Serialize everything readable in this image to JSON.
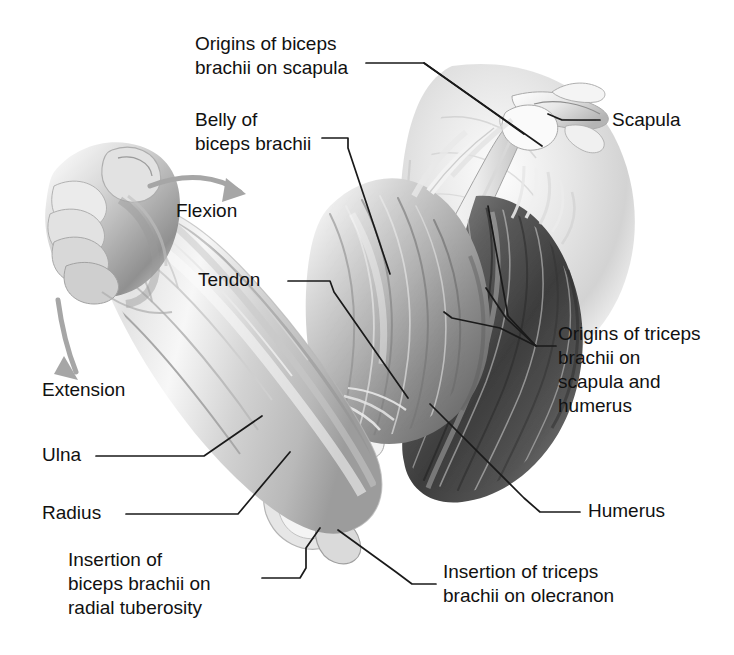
{
  "figure": {
    "background_color": "#ffffff",
    "ink_color": "#111111",
    "leader_line_color": "#1a1a1a",
    "motion_arrow_color": "#9a9a9a",
    "style": "grayscale medical illustration"
  },
  "labels": {
    "origins_biceps": "Origins of biceps\nbrachii on scapula",
    "belly_biceps": "Belly of\nbiceps brachii",
    "scapula": "Scapula",
    "tendon": "Tendon",
    "origins_triceps": "Origins of triceps\nbrachii on\nscapula and\nhumerus",
    "humerus": "Humerus",
    "insertion_triceps": "Insertion of triceps\nbrachii on olecranon",
    "insertion_biceps": "Insertion of\nbiceps brachii on\nradial tuberosity",
    "ulna": "Ulna",
    "radius": "Radius",
    "flexion": "Flexion",
    "extension": "Extension"
  },
  "motion_arrows": [
    {
      "name": "flexion-arrow",
      "direction": "clockwise-right",
      "label": "Flexion"
    },
    {
      "name": "extension-arrow",
      "direction": "down-left",
      "label": "Extension"
    }
  ],
  "anatomical_structures": [
    {
      "name": "fist",
      "region": "hand"
    },
    {
      "name": "forearm",
      "region": "forearm"
    },
    {
      "name": "ulna",
      "region": "forearm-bone"
    },
    {
      "name": "radius",
      "region": "forearm-bone"
    },
    {
      "name": "olecranon",
      "region": "elbow"
    },
    {
      "name": "biceps-brachii-belly",
      "region": "upper-arm-anterior"
    },
    {
      "name": "biceps-brachii-tendon",
      "region": "elbow-anterior"
    },
    {
      "name": "triceps-brachii",
      "region": "upper-arm-posterior"
    },
    {
      "name": "humerus",
      "region": "upper-arm-bone"
    },
    {
      "name": "scapula",
      "region": "shoulder"
    },
    {
      "name": "deltoid-shoulder-mass",
      "region": "shoulder"
    }
  ]
}
